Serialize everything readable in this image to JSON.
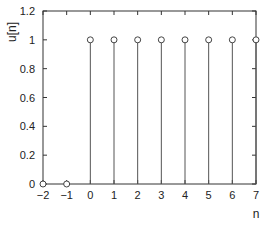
{
  "chart_data": {
    "type": "stem",
    "title": "",
    "xlabel": "n",
    "ylabel": "u[n]",
    "x": [
      -2,
      -1,
      0,
      1,
      2,
      3,
      4,
      5,
      6,
      7
    ],
    "values": [
      0,
      0,
      1,
      1,
      1,
      1,
      1,
      1,
      1,
      1
    ],
    "xlim": [
      -2,
      7
    ],
    "ylim": [
      0,
      1.2
    ],
    "xticks": [
      -2,
      -1,
      0,
      1,
      2,
      3,
      4,
      5,
      6,
      7
    ],
    "xtick_labels": [
      "−2",
      "−1",
      "0",
      "1",
      "2",
      "3",
      "4",
      "5",
      "6",
      "7"
    ],
    "yticks": [
      0,
      0.2,
      0.4,
      0.6,
      0.8,
      1,
      1.2
    ],
    "ytick_labels": [
      "0",
      "0.2",
      "0.4",
      "0.6",
      "0.8",
      "1",
      "1.2"
    ],
    "grid": false,
    "legend": null,
    "colors": {
      "stem": "#555555",
      "axis": "#333333",
      "marker_edge": "#444444"
    }
  }
}
